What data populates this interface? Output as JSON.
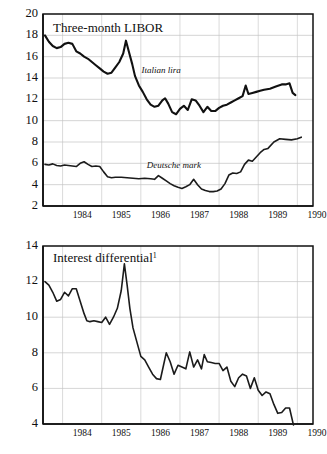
{
  "figure": {
    "background": "#ffffff",
    "line_color": "#111111",
    "grid_color": "#bdbdbd"
  },
  "chart_data": [
    {
      "type": "line",
      "title": "Three-month LIBOR",
      "xlabel": "",
      "ylabel": "",
      "grid": true,
      "legend_position": "inline-annotation",
      "xlim": [
        1983.5,
        1990.4
      ],
      "ylim": [
        2,
        20
      ],
      "yticks": [
        2,
        4,
        6,
        8,
        10,
        12,
        14,
        16,
        18,
        20
      ],
      "xticks": [
        1984,
        1985,
        1986,
        1987,
        1988,
        1989,
        1990
      ],
      "xtick_labels": [
        "1984",
        "1985",
        "1986",
        "1987",
        "1988",
        "1989",
        "1990"
      ],
      "series": [
        {
          "name": "Italian lira",
          "label_x": 1986.02,
          "label_y": 14.45,
          "x": [
            1983.55,
            1983.65,
            1983.75,
            1983.85,
            1983.95,
            1984.05,
            1984.15,
            1984.25,
            1984.35,
            1984.45,
            1984.55,
            1984.65,
            1984.75,
            1984.85,
            1984.95,
            1985.05,
            1985.15,
            1985.25,
            1985.35,
            1985.45,
            1985.55,
            1985.62,
            1985.7,
            1985.78,
            1985.85,
            1985.95,
            1986.05,
            1986.15,
            1986.25,
            1986.35,
            1986.45,
            1986.55,
            1986.62,
            1986.7,
            1986.8,
            1986.9,
            1987.0,
            1987.1,
            1987.2,
            1987.3,
            1987.4,
            1987.5,
            1987.6,
            1987.7,
            1987.8,
            1987.9,
            1988.0,
            1988.1,
            1988.2,
            1988.3,
            1988.4,
            1988.5,
            1988.6,
            1988.68,
            1988.75,
            1988.85,
            1988.95,
            1989.05,
            1989.15,
            1989.3,
            1989.45,
            1989.6,
            1989.7,
            1989.8,
            1989.88,
            1989.95
          ],
          "y": [
            18.0,
            17.4,
            17.0,
            16.8,
            16.9,
            17.2,
            17.3,
            17.2,
            16.5,
            16.3,
            16.0,
            15.8,
            15.5,
            15.2,
            14.9,
            14.6,
            14.4,
            14.5,
            15.0,
            15.5,
            16.3,
            17.5,
            16.4,
            15.3,
            14.2,
            13.3,
            12.7,
            12.0,
            11.5,
            11.3,
            11.4,
            11.9,
            12.1,
            11.6,
            10.8,
            10.6,
            11.1,
            11.4,
            11.0,
            12.0,
            11.9,
            11.4,
            10.8,
            11.3,
            10.9,
            10.9,
            11.2,
            11.4,
            11.5,
            11.7,
            11.9,
            12.1,
            12.3,
            13.3,
            12.5,
            12.6,
            12.7,
            12.8,
            12.9,
            13.0,
            13.2,
            13.4,
            13.4,
            13.5,
            12.6,
            12.4
          ]
        },
        {
          "name": "Deutsche mark",
          "label_x": 1986.15,
          "label_y": 5.55,
          "x": [
            1983.55,
            1983.65,
            1983.75,
            1983.85,
            1983.95,
            1984.05,
            1984.15,
            1984.25,
            1984.35,
            1984.45,
            1984.55,
            1984.65,
            1984.75,
            1984.85,
            1984.95,
            1985.05,
            1985.15,
            1985.25,
            1985.35,
            1985.5,
            1985.65,
            1985.8,
            1985.95,
            1986.1,
            1986.25,
            1986.35,
            1986.45,
            1986.55,
            1986.65,
            1986.75,
            1986.85,
            1986.95,
            1987.05,
            1987.15,
            1987.25,
            1987.35,
            1987.45,
            1987.55,
            1987.65,
            1987.75,
            1987.85,
            1987.95,
            1988.05,
            1988.15,
            1988.25,
            1988.35,
            1988.45,
            1988.55,
            1988.65,
            1988.75,
            1988.85,
            1988.95,
            1989.05,
            1989.15,
            1989.25,
            1989.4,
            1989.55,
            1989.7,
            1989.85,
            1990.0,
            1990.1
          ],
          "y": [
            5.9,
            5.85,
            5.95,
            5.8,
            5.75,
            5.85,
            5.8,
            5.75,
            5.7,
            6.0,
            6.15,
            5.9,
            5.7,
            5.75,
            5.7,
            5.2,
            4.75,
            4.65,
            4.7,
            4.7,
            4.65,
            4.6,
            4.55,
            4.6,
            4.55,
            4.5,
            4.85,
            4.6,
            4.35,
            4.1,
            3.9,
            3.75,
            3.65,
            3.8,
            4.0,
            4.5,
            4.0,
            3.6,
            3.45,
            3.35,
            3.35,
            3.4,
            3.6,
            4.1,
            4.9,
            5.1,
            5.05,
            5.2,
            5.9,
            6.3,
            6.2,
            6.6,
            7.0,
            7.3,
            7.4,
            8.0,
            8.3,
            8.25,
            8.2,
            8.3,
            8.45
          ]
        }
      ]
    },
    {
      "type": "line",
      "title": "Interest differential",
      "title_superscript": "1",
      "xlabel": "",
      "ylabel": "",
      "grid": true,
      "legend_position": "none",
      "xlim": [
        1983.5,
        1990.4
      ],
      "ylim": [
        4,
        14
      ],
      "yticks": [
        4,
        6,
        8,
        10,
        12,
        14
      ],
      "xticks": [
        1984,
        1985,
        1986,
        1987,
        1988,
        1989,
        1990
      ],
      "xtick_labels": [
        "1984",
        "1985",
        "1986",
        "1987",
        "1988",
        "1989",
        "1990"
      ],
      "series": [
        {
          "name": "Interest differential",
          "x": [
            1983.55,
            1983.65,
            1983.75,
            1983.85,
            1983.95,
            1984.05,
            1984.15,
            1984.25,
            1984.35,
            1984.45,
            1984.55,
            1984.62,
            1984.7,
            1984.8,
            1984.9,
            1985.0,
            1985.1,
            1985.2,
            1985.3,
            1985.4,
            1985.5,
            1985.58,
            1985.65,
            1985.72,
            1985.8,
            1985.9,
            1986.0,
            1986.1,
            1986.2,
            1986.3,
            1986.4,
            1986.5,
            1986.58,
            1986.65,
            1986.75,
            1986.85,
            1986.95,
            1987.05,
            1987.15,
            1987.25,
            1987.35,
            1987.45,
            1987.55,
            1987.62,
            1987.7,
            1987.8,
            1987.9,
            1988.0,
            1988.1,
            1988.2,
            1988.3,
            1988.4,
            1988.5,
            1988.6,
            1988.7,
            1988.8,
            1988.9,
            1989.0,
            1989.1,
            1989.2,
            1989.3,
            1989.4,
            1989.5,
            1989.6,
            1989.7,
            1989.8,
            1989.9
          ],
          "y": [
            12.0,
            11.8,
            11.4,
            10.9,
            11.0,
            11.4,
            11.2,
            11.6,
            11.6,
            10.9,
            10.2,
            9.8,
            9.75,
            9.8,
            9.75,
            9.7,
            10.0,
            9.6,
            10.0,
            10.5,
            11.5,
            13.0,
            11.8,
            10.5,
            9.4,
            8.6,
            7.8,
            7.6,
            7.2,
            6.8,
            6.55,
            6.5,
            7.3,
            8.0,
            7.5,
            6.8,
            7.3,
            7.2,
            7.1,
            8.05,
            7.2,
            7.6,
            7.1,
            7.9,
            7.5,
            7.45,
            7.4,
            7.4,
            7.0,
            7.2,
            6.4,
            6.1,
            6.6,
            6.8,
            6.7,
            6.0,
            6.6,
            5.9,
            5.6,
            5.8,
            5.7,
            5.1,
            4.6,
            4.65,
            4.9,
            4.9,
            3.95
          ]
        }
      ]
    }
  ]
}
